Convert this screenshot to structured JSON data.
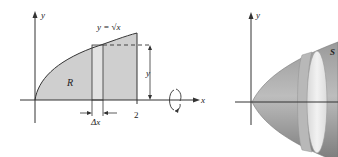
{
  "figure_left": {
    "axis_x_label": "x",
    "axis_y_label": "y",
    "curve_label": "y = √x",
    "region_label": "R",
    "height_label": "y",
    "width_label": "Δx",
    "tick_label": "2",
    "region_fill": "#cfcfcf",
    "strip_fill": "#e4e4e4"
  },
  "figure_right": {
    "axis_y_label": "y",
    "surface_label": "S",
    "surface_color": "#8c8c8c",
    "disk_color": "#e6e6e6"
  }
}
